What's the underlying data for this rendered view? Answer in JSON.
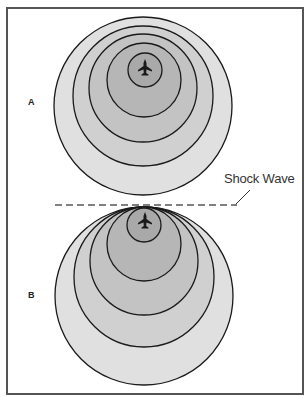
{
  "figure": {
    "panel_a": {
      "label": "A",
      "rings": [
        {
          "cx": 143,
          "cy": 106,
          "r": 89,
          "fill": "#e0e0e0"
        },
        {
          "cx": 143,
          "cy": 96,
          "r": 70,
          "fill": "#d0d0d0"
        },
        {
          "cx": 143,
          "cy": 88,
          "r": 54,
          "fill": "#c3c3c3"
        },
        {
          "cx": 144,
          "cy": 80,
          "r": 37,
          "fill": "#b6b6b6"
        },
        {
          "cx": 145,
          "cy": 70,
          "r": 17,
          "fill": "#a9a9a9"
        }
      ],
      "aircraft": {
        "x": 145,
        "y": 67
      }
    },
    "panel_b": {
      "label": "B",
      "rings": [
        {
          "cx": 144,
          "cy": 296,
          "r": 89,
          "fill": "#e0e0e0"
        },
        {
          "cx": 144,
          "cy": 277,
          "r": 70,
          "fill": "#d0d0d0"
        },
        {
          "cx": 144,
          "cy": 261,
          "r": 54,
          "fill": "#c3c3c3"
        },
        {
          "cx": 144,
          "cy": 244,
          "r": 37,
          "fill": "#b6b6b6"
        },
        {
          "cx": 144,
          "cy": 225,
          "r": 17,
          "fill": "#a9a9a9"
        }
      ],
      "aircraft": {
        "x": 145,
        "y": 220
      }
    },
    "shock_wave": {
      "label": "Shock Wave",
      "line_color": "#808080",
      "line_y": 205,
      "line_x1": 55,
      "line_x2": 237
    },
    "colors": {
      "ring_stroke": "#1a1a1a",
      "frame": "#555555",
      "aircraft": "#1a1a1a"
    }
  }
}
